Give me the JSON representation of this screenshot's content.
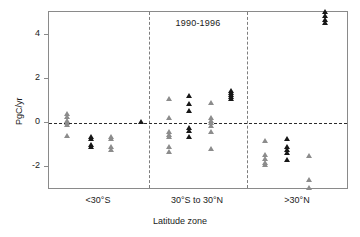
{
  "chart_data": {
    "type": "scatter",
    "title": "1990-1996",
    "xlabel": "Latitude zone",
    "ylabel": "PgC/yr",
    "categories": [
      "<30°S",
      "30°S to 30°N",
      ">30°N"
    ],
    "yticks": [
      -2,
      0,
      2,
      4
    ],
    "ylim": [
      -3.4,
      5.4
    ],
    "grid": false,
    "legend": "none",
    "annotations": [
      "dashed horizontal reference line at y = 0",
      "dashed vertical separators between latitude zones"
    ],
    "series": [
      {
        "name": "gray",
        "color": "#8c8c8c",
        "points": [
          {
            "zone": "<30°S",
            "col": 1,
            "value": 0.45
          },
          {
            "zone": "<30°S",
            "col": 1,
            "value": 0.3
          },
          {
            "zone": "<30°S",
            "col": 1,
            "value": 0.1
          },
          {
            "zone": "<30°S",
            "col": 1,
            "value": 0.02
          },
          {
            "zone": "<30°S",
            "col": 1,
            "value": -0.08
          },
          {
            "zone": "<30°S",
            "col": 1,
            "value": -0.55
          },
          {
            "zone": "<30°S",
            "col": 3,
            "value": -0.6
          },
          {
            "zone": "<30°S",
            "col": 3,
            "value": -0.7
          },
          {
            "zone": "<30°S",
            "col": 3,
            "value": -1.05
          },
          {
            "zone": "<30°S",
            "col": 3,
            "value": -1.2
          },
          {
            "zone": "30°S to 30°N",
            "col": 1,
            "value": 1.12
          },
          {
            "zone": "30°S to 30°N",
            "col": 1,
            "value": 0.25
          },
          {
            "zone": "30°S to 30°N",
            "col": 1,
            "value": -0.4
          },
          {
            "zone": "30°S to 30°N",
            "col": 1,
            "value": -0.52
          },
          {
            "zone": "30°S to 30°N",
            "col": 1,
            "value": -0.62
          },
          {
            "zone": "30°S to 30°N",
            "col": 1,
            "value": -1.08
          },
          {
            "zone": "30°S to 30°N",
            "col": 1,
            "value": -1.3
          },
          {
            "zone": "30°S to 30°N",
            "col": 3,
            "value": 0.92
          },
          {
            "zone": "30°S to 30°N",
            "col": 3,
            "value": 0.25
          },
          {
            "zone": "30°S to 30°N",
            "col": 3,
            "value": 0.12
          },
          {
            "zone": "30°S to 30°N",
            "col": 3,
            "value": 0.02
          },
          {
            "zone": "30°S to 30°N",
            "col": 3,
            "value": -0.1
          },
          {
            "zone": "30°S to 30°N",
            "col": 3,
            "value": -0.4
          },
          {
            "zone": "30°S to 30°N",
            "col": 3,
            "value": -1.18
          },
          {
            "zone": ">30°N",
            "col": 1,
            "value": -0.78
          },
          {
            "zone": ">30°N",
            "col": 1,
            "value": -1.45
          },
          {
            "zone": ">30°N",
            "col": 1,
            "value": -1.6
          },
          {
            "zone": ">30°N",
            "col": 1,
            "value": -1.78
          },
          {
            "zone": ">30°N",
            "col": 1,
            "value": -1.9
          },
          {
            "zone": ">30°N",
            "col": 3,
            "value": -1.48
          },
          {
            "zone": ">30°N",
            "col": 3,
            "value": -2.55
          },
          {
            "zone": ">30°N",
            "col": 3,
            "value": -2.95
          }
        ]
      },
      {
        "name": "black",
        "color": "#171717",
        "points": [
          {
            "zone": "<30°S",
            "col": 2,
            "value": -0.62
          },
          {
            "zone": "<30°S",
            "col": 2,
            "value": -0.72
          },
          {
            "zone": "<30°S",
            "col": 2,
            "value": -0.98
          },
          {
            "zone": "<30°S",
            "col": 2,
            "value": -1.05
          },
          {
            "zone": "<30°S",
            "col": 4,
            "value": 0.08
          },
          {
            "zone": "30°S to 30°N",
            "col": 2,
            "value": 1.25
          },
          {
            "zone": "30°S to 30°N",
            "col": 2,
            "value": 0.88
          },
          {
            "zone": "30°S to 30°N",
            "col": 2,
            "value": 0.55
          },
          {
            "zone": "30°S to 30°N",
            "col": 2,
            "value": -0.22
          },
          {
            "zone": "30°S to 30°N",
            "col": 2,
            "value": -0.35
          },
          {
            "zone": "30°S to 30°N",
            "col": 2,
            "value": -0.6
          },
          {
            "zone": "30°S to 30°N",
            "col": 4,
            "value": 1.48
          },
          {
            "zone": "30°S to 30°N",
            "col": 4,
            "value": 1.38
          },
          {
            "zone": "30°S to 30°N",
            "col": 4,
            "value": 1.3
          },
          {
            "zone": "30°S to 30°N",
            "col": 4,
            "value": 1.2
          },
          {
            "zone": "30°S to 30°N",
            "col": 4,
            "value": 1.12
          },
          {
            "zone": ">30°N",
            "col": 2,
            "value": -0.72
          },
          {
            "zone": ">30°N",
            "col": 2,
            "value": -1.08
          },
          {
            "zone": ">30°N",
            "col": 2,
            "value": -1.22
          },
          {
            "zone": ">30°N",
            "col": 2,
            "value": -1.32
          },
          {
            "zone": ">30°N",
            "col": 2,
            "value": -1.68
          },
          {
            "zone": ">30°N",
            "col": 4,
            "value": 5.05
          },
          {
            "zone": ">30°N",
            "col": 4,
            "value": 4.88
          },
          {
            "zone": ">30°N",
            "col": 4,
            "value": 4.72
          },
          {
            "zone": ">30°N",
            "col": 4,
            "value": 4.58
          }
        ]
      }
    ]
  },
  "layout": {
    "panel": {
      "left": 48,
      "top": 11,
      "width": 300,
      "height": 178
    },
    "y_axis": {
      "px_at": {
        "4": 35,
        "2": 78,
        "0": 122,
        "-2": 165
      }
    },
    "zone_column_x": {
      "<30°S": {
        "1": 66,
        "2": 90,
        "3": 110,
        "4": 140
      },
      "30°S to 30°N": {
        "1": 168,
        "2": 188,
        "3": 210,
        "4": 230
      },
      ">30°N": {
        "1": 264,
        "2": 286,
        "3": 308,
        "4": 324
      }
    },
    "separators_x": [
      148,
      246
    ],
    "zone_label_x": {
      "<30°S": 98,
      "30°S to 30°N": 197,
      ">30°N": 297
    }
  }
}
